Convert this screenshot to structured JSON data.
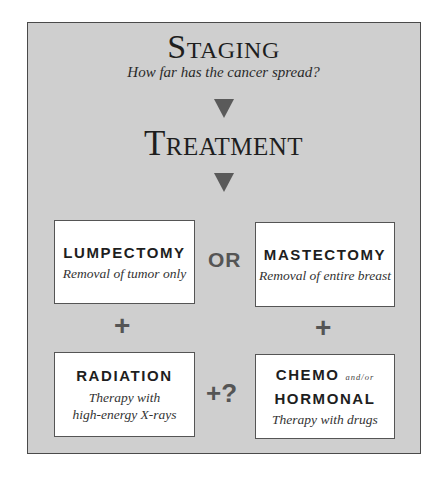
{
  "header": {
    "title": "Staging",
    "subtitle": "How far has the cancer spread?",
    "second_title": "Treatment"
  },
  "connectors": {
    "arrow1": "down-triangle",
    "arrow2": "down-triangle",
    "or_label": "OR",
    "plus_left": "+",
    "plus_right": "+",
    "plus_maybe": "+?"
  },
  "boxes": {
    "lumpectomy": {
      "title": "LUMPECTOMY",
      "description": "Removal of tumor only"
    },
    "mastectomy": {
      "title": "MASTECTOMY",
      "description": "Removal of entire breast"
    },
    "radiation": {
      "title": "RADIATION",
      "description_line1": "Therapy with",
      "description_line2": "high-energy X-rays"
    },
    "chemo": {
      "title_line1": "CHEMO",
      "qualifier": "and/or",
      "title_line2": "HORMONAL",
      "description": "Therapy with drugs"
    }
  },
  "colors": {
    "panel_bg": "#cfcfcf",
    "border": "#4a4a4a",
    "triangle": "#5a5a5a",
    "text": "#1e1e1e"
  }
}
